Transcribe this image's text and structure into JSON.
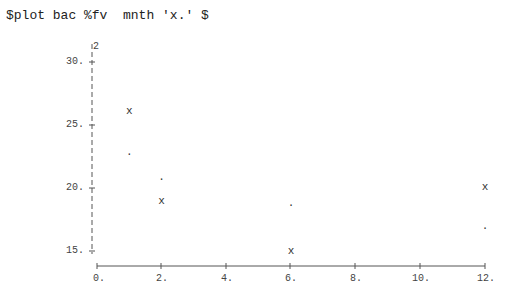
{
  "command": "$plot bac %fv  mnth 'x.' $",
  "chart_data": {
    "type": "scatter",
    "title": "$plot bac %fv  mnth 'x.' $",
    "xlabel": "mnth",
    "ylabel": "",
    "y_axis_marker": "2",
    "xlim": [
      0,
      12
    ],
    "ylim": [
      15,
      30
    ],
    "x_ticks": [
      "0.",
      "2.",
      "4.",
      "6.",
      "8.",
      "10.",
      "12."
    ],
    "y_ticks": [
      "30.",
      "25.",
      "20.",
      "15."
    ],
    "grid": false,
    "series": [
      {
        "name": "bac",
        "marker": "x",
        "x": [
          1,
          2,
          6,
          12
        ],
        "y": [
          26.0,
          18.9,
          14.9,
          20.0
        ]
      },
      {
        "name": "fv",
        "marker": ".",
        "x": [
          1,
          2,
          6,
          12
        ],
        "y": [
          22.8,
          20.8,
          18.7,
          16.9
        ]
      }
    ]
  }
}
